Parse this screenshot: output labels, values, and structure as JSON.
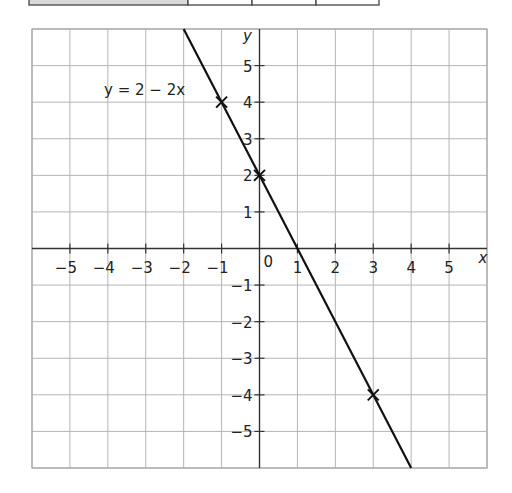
{
  "table_strip": {
    "cells": [
      {
        "x0": 29,
        "x1": 188,
        "shaded": true
      },
      {
        "x0": 188,
        "x1": 252,
        "shaded": false
      },
      {
        "x0": 252,
        "x1": 316,
        "shaded": false
      },
      {
        "x0": 316,
        "x1": 379,
        "shaded": false
      }
    ],
    "shade_color": "#d9d9d9"
  },
  "chart_data": {
    "type": "line",
    "title": "",
    "xlabel": "x",
    "ylabel": "y",
    "xlim": [
      -6,
      6
    ],
    "ylim": [
      -6,
      6
    ],
    "grid": true,
    "x_ticks": [
      -5,
      -4,
      -3,
      -2,
      -1,
      1,
      2,
      3,
      4,
      5
    ],
    "y_ticks": [
      -5,
      -4,
      -3,
      -2,
      -1,
      1,
      2,
      3,
      4,
      5
    ],
    "x_tick_labels": [
      "−5",
      "−4",
      "−3",
      "−2",
      "−1",
      "1",
      "2",
      "3",
      "4",
      "5"
    ],
    "y_tick_labels": [
      "−5",
      "−4",
      "−3",
      "−2",
      "−1",
      "1",
      "2",
      "3",
      "4",
      "5"
    ],
    "origin_label": "0",
    "series": [
      {
        "name": "y = 2 − 2x",
        "equation": "y = 2 - 2x",
        "x": [
          -2,
          4
        ],
        "y": [
          6,
          -6
        ],
        "color": "#111111"
      }
    ],
    "marked_points": [
      {
        "x": -1,
        "y": 4,
        "marker": "x"
      },
      {
        "x": 0,
        "y": 2,
        "marker": "x"
      },
      {
        "x": 3,
        "y": -4,
        "marker": "x"
      }
    ],
    "annotations": [
      {
        "text": "y = 2 − 2x",
        "x": -4.1,
        "y": 4.35
      }
    ]
  },
  "colors": {
    "grid": "#b5b5b5",
    "axes": "#333333",
    "line": "#111111",
    "border": "#a8a8a8"
  }
}
